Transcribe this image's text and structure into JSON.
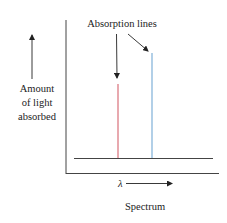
{
  "diagram": {
    "annotation_label": "Absorption lines",
    "y_axis_label_lines": [
      "Amount",
      "of light",
      "absorbed"
    ],
    "x_axis_symbol": "λ",
    "x_axis_label": "Spectrum",
    "lines": [
      {
        "name": "red-absorption-line",
        "color": "#d9707a",
        "x": 118,
        "top": 84
      },
      {
        "name": "blue-absorption-line",
        "color": "#7fb0d8",
        "x": 152,
        "top": 53
      }
    ],
    "colors": {
      "axis": "#333333",
      "red_line": "#d9707a",
      "blue_line": "#7fb0d8"
    }
  }
}
